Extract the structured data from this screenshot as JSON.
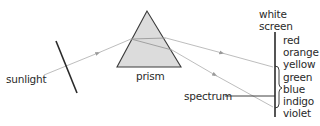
{
  "diagram": {
    "labels": {
      "sunlight": "sunlight",
      "prism": "prism",
      "white_screen_line1": "white",
      "white_screen_line2": "screen",
      "spectrum": "spectrum"
    },
    "spectrum_colors": [
      "red",
      "orange",
      "yellow",
      "green",
      "blue",
      "indigo",
      "violet"
    ],
    "colors": {
      "prism_fill": "#dcdcdc",
      "prism_stroke": "#3a3a3a",
      "ray": "#b0b0b0",
      "line": "#2a2a2a",
      "text": "#2a2a2a"
    }
  }
}
